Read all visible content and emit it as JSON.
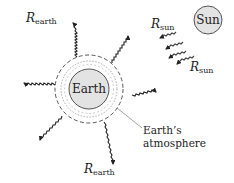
{
  "diagram": {
    "colors": {
      "earth_fill": "#e3e3e3",
      "sun_fill": "#e3e3e3",
      "stroke": "#333333",
      "background": "#ffffff"
    },
    "earth": {
      "label": "Earth"
    },
    "sun": {
      "label": "Sun"
    },
    "atmosphere": {
      "label_line1": "Earth’s",
      "label_line2": "atmosphere"
    },
    "labels": {
      "r_earth_top": {
        "main": "R",
        "sub": "earth"
      },
      "r_earth_bottom": {
        "main": "R",
        "sub": "earth"
      },
      "r_sun_top": {
        "main": "R",
        "sub": "sun"
      },
      "r_sun_bottom": {
        "main": "R",
        "sub": "sun"
      }
    },
    "arrows": {
      "earth_outgoing_count": 6,
      "sun_incoming_count": 4
    }
  }
}
